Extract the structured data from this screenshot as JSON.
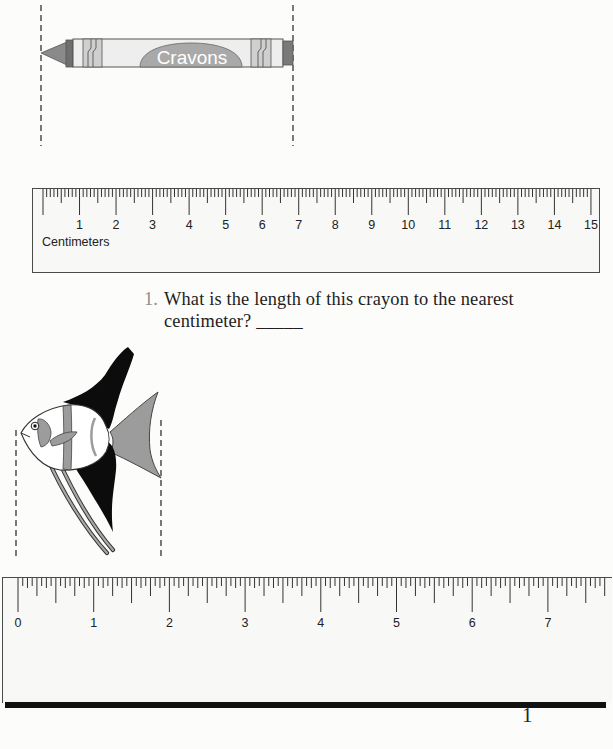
{
  "crayon": {
    "label": "Cravons",
    "colors": {
      "tip": "#8a8a8a",
      "collar": "#6f6f6f",
      "body": "#eeeeee",
      "band": "#c8c8c8",
      "label_bg": "#a9a9a9",
      "cap": "#7a7a7a"
    }
  },
  "ruler_cm": {
    "unit_label": "Centimeters",
    "zero_x": 10,
    "px_per_unit": 36.53,
    "units": 15,
    "subdivisions": 10,
    "labels": [
      "1",
      "2",
      "3",
      "4",
      "5",
      "6",
      "7",
      "8",
      "9",
      "10",
      "11",
      "12",
      "13",
      "14",
      "15"
    ]
  },
  "question": {
    "number": "1.",
    "line1": "What is the length of this crayon to the nearest",
    "line2": "centimeter?",
    "answer_blank": "_____"
  },
  "ruler_in": {
    "zero_x": 15,
    "px_per_unit": 75.7,
    "subdivisions": 16,
    "labels": [
      "0",
      "1",
      "2",
      "3",
      "4",
      "5",
      "6",
      "7"
    ]
  },
  "page_number": "1"
}
